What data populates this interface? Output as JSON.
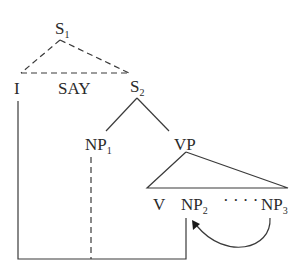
{
  "diagram": {
    "nodes": {
      "s1": {
        "label": "S",
        "sub": "1"
      },
      "i": {
        "label": "I"
      },
      "say": {
        "label": "SAY"
      },
      "s2": {
        "label": "S",
        "sub": "2"
      },
      "np1": {
        "label": "NP",
        "sub": "1"
      },
      "vp": {
        "label": "VP"
      },
      "v": {
        "label": "V"
      },
      "np2": {
        "label": "NP",
        "sub": "2"
      },
      "ellipsis": {
        "label": "· · · ·"
      },
      "np3": {
        "label": "NP",
        "sub": "3"
      }
    },
    "edges": [
      {
        "from": "S1",
        "to": "I",
        "style": "dashed"
      },
      {
        "from": "S1",
        "to": "S2",
        "style": "dashed"
      },
      {
        "from": "I",
        "to": "S2",
        "style": "dashed",
        "note": "horizontal through SAY"
      },
      {
        "from": "S2",
        "to": "NP1",
        "style": "solid"
      },
      {
        "from": "S2",
        "to": "VP",
        "style": "solid"
      },
      {
        "from": "VP",
        "to": "V ... NP3",
        "style": "solid triangle"
      },
      {
        "from": "I",
        "to": "NP2",
        "style": "solid connector"
      },
      {
        "from": "NP1",
        "to": "connector",
        "style": "dashed"
      },
      {
        "from": "NP3",
        "to": "NP2",
        "style": "curved arrow"
      }
    ]
  }
}
